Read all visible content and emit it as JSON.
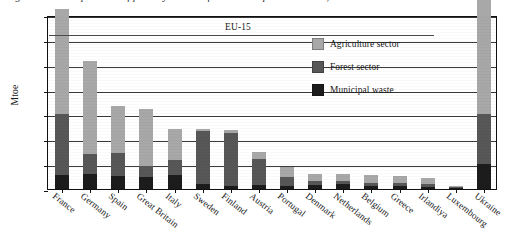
{
  "top_caption": {
    "text": "Fig. 1. Technical potential of primary solid biofuels in European countries, Mtoe"
  },
  "annotation": {
    "eu15_label": "EU-15"
  },
  "legend": {
    "position": "inside-top-right",
    "items": [
      {
        "label": "Agriculture sector",
        "color": "#a8a8a8",
        "key": "agriculture"
      },
      {
        "label": "Forest sector",
        "color": "#575757",
        "key": "forest"
      },
      {
        "label": "Municipal waste",
        "color": "#1c1c1c",
        "key": "municipal"
      }
    ]
  },
  "axes": {
    "ylabel": "Mtoe",
    "xlabel": "",
    "yticks": [
      "0.0",
      "5.0",
      "10.0",
      "15.0",
      "20.0",
      "25.0",
      "30.0",
      "35.0"
    ],
    "ytick_values": [
      0,
      5,
      10,
      15,
      20,
      25,
      30,
      35
    ],
    "ylim": [
      0,
      35
    ],
    "grid": true
  },
  "chart_data": {
    "type": "bar",
    "title": "Technical potential of primary solid biofuels in European countries",
    "subtitle": "",
    "xlabel": "",
    "ylabel": "Mtoe",
    "ylim": [
      0,
      35
    ],
    "grid": true,
    "stacked": true,
    "legend_position": "inside-top-right",
    "categories": [
      "France",
      "Germany",
      "Spain",
      "Great Britain",
      "Italy",
      "Sweden",
      "Finland",
      "Austria",
      "Portugal",
      "Denmark",
      "Netherlands",
      "Belgium",
      "Greece",
      "Irlandiya",
      "Luxembourg",
      "Ukraine"
    ],
    "series": [
      {
        "name": "Municipal waste",
        "color": "#1c1c1c",
        "values": [
          2.8,
          3.0,
          2.6,
          2.4,
          2.8,
          1.0,
          0.7,
          0.8,
          0.6,
          0.9,
          1.0,
          0.7,
          0.7,
          0.5,
          0.1,
          5.0
        ]
      },
      {
        "name": "Forest sector",
        "color": "#575757",
        "values": [
          12.2,
          4.0,
          4.6,
          2.2,
          3.0,
          10.6,
          10.6,
          5.3,
          1.9,
          0.8,
          0.7,
          0.6,
          0.5,
          0.5,
          0.1,
          10.0
        ]
      },
      {
        "name": "Agriculture sector",
        "color": "#a8a8a8",
        "values": [
          21.3,
          18.8,
          9.5,
          11.6,
          6.2,
          0.5,
          0.6,
          1.3,
          2.0,
          1.4,
          1.3,
          1.6,
          1.5,
          1.2,
          0.1,
          23.5
        ]
      }
    ],
    "totals": [
      36.3,
      25.8,
      16.7,
      16.2,
      12.0,
      12.1,
      11.9,
      7.4,
      4.5,
      3.1,
      3.0,
      2.9,
      2.7,
      2.2,
      0.3,
      38.5
    ]
  }
}
